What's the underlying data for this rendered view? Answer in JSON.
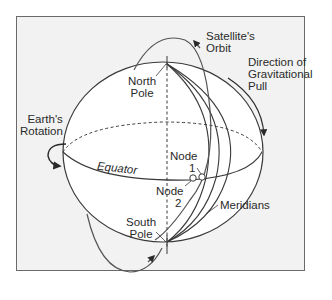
{
  "diagram": {
    "labels": {
      "satellite_orbit_line1": "Satellite's",
      "satellite_orbit_line2": "Orbit",
      "gravity_line1": "Direction of",
      "gravity_line2": "Gravitational",
      "gravity_line3": "Pull",
      "north_pole_line1": "North",
      "north_pole_line2": "Pole",
      "rotation_line1": "Earth's",
      "rotation_line2": "Rotation",
      "equator": "Equator",
      "node1_line1": "Node",
      "node1_line2": "1",
      "node2_line1": "Node",
      "node2_line2": "2",
      "south_pole_line1": "South",
      "south_pole_line2": "Pole",
      "meridians": "Meridians"
    },
    "colors": {
      "background": "#f2f2f2",
      "sphere_fill": "#ffffff",
      "line": "#3a3a3a",
      "frame_border": "#6a6a6a"
    }
  }
}
